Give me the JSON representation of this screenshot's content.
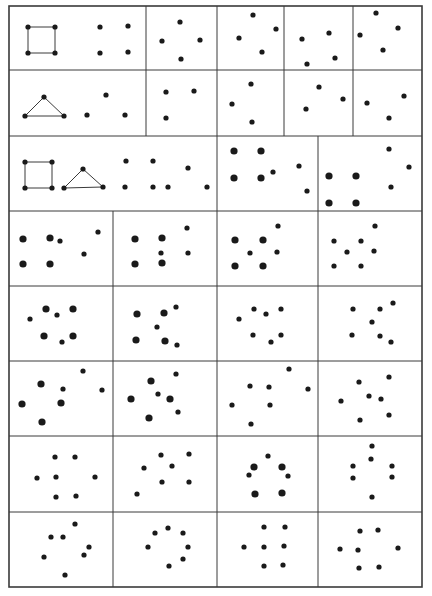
{
  "figure": {
    "title": "",
    "background": "#ffffff",
    "ink_color": "#1a1a1a",
    "line_color": "#3a3a3a",
    "outer_border": {
      "x1": 9,
      "y1": 6,
      "x2": 422,
      "y2": 587
    },
    "small_dot_r": 2.6,
    "big_dot_r": 3.6,
    "rows": [
      {
        "y1": 6,
        "y2": 70,
        "dividers": [
          146,
          217,
          284,
          353
        ]
      },
      {
        "y1": 70,
        "y2": 136,
        "dividers": [
          146,
          217,
          284,
          353
        ]
      },
      {
        "y1": 136,
        "y2": 211,
        "dividers": [
          217,
          318
        ]
      },
      {
        "y1": 211,
        "y2": 286,
        "dividers": [
          113,
          217,
          318
        ]
      },
      {
        "y1": 286,
        "y2": 361,
        "dividers": [
          113,
          217,
          318
        ]
      },
      {
        "y1": 361,
        "y2": 436,
        "dividers": [
          113,
          217,
          318
        ]
      },
      {
        "y1": 436,
        "y2": 512,
        "dividers": [
          113,
          217,
          318
        ]
      },
      {
        "y1": 512,
        "y2": 587,
        "dividers": [
          113,
          217,
          318
        ]
      }
    ],
    "shapes": [
      {
        "name": "square-r1",
        "type": "polygon",
        "points": [
          [
            28,
            27
          ],
          [
            55,
            27
          ],
          [
            55,
            53
          ],
          [
            28,
            53
          ]
        ]
      },
      {
        "name": "triangle-r2",
        "type": "polygon",
        "points": [
          [
            44,
            97
          ],
          [
            64,
            116
          ],
          [
            25,
            116
          ]
        ]
      },
      {
        "name": "square-r3",
        "type": "polygon",
        "points": [
          [
            25,
            162
          ],
          [
            52,
            162
          ],
          [
            52,
            188
          ],
          [
            25,
            188
          ]
        ]
      },
      {
        "name": "triangle-r3",
        "type": "polygon",
        "points": [
          [
            83,
            169
          ],
          [
            103,
            187
          ],
          [
            64,
            188
          ]
        ]
      }
    ],
    "cells": [
      {
        "row": 1,
        "col": 1,
        "small": [
          [
            28,
            27
          ],
          [
            55,
            27
          ],
          [
            28,
            53
          ],
          [
            55,
            53
          ],
          [
            100,
            27
          ],
          [
            128,
            26
          ],
          [
            100,
            53
          ],
          [
            128,
            52
          ]
        ],
        "big": []
      },
      {
        "row": 1,
        "col": 2,
        "small": [
          [
            180,
            22
          ],
          [
            162,
            41
          ],
          [
            200,
            40
          ],
          [
            181,
            59
          ]
        ],
        "big": []
      },
      {
        "row": 1,
        "col": 3,
        "small": [
          [
            253,
            15
          ],
          [
            239,
            38
          ],
          [
            276,
            29
          ],
          [
            262,
            52
          ]
        ],
        "big": []
      },
      {
        "row": 1,
        "col": 4,
        "small": [
          [
            302,
            39
          ],
          [
            329,
            33
          ],
          [
            307,
            64
          ],
          [
            335,
            58
          ]
        ],
        "big": []
      },
      {
        "row": 1,
        "col": 5,
        "small": [
          [
            376,
            13
          ],
          [
            360,
            35
          ],
          [
            398,
            28
          ],
          [
            383,
            50
          ]
        ],
        "big": []
      },
      {
        "row": 2,
        "col": 1,
        "small": [
          [
            44,
            97
          ],
          [
            25,
            116
          ],
          [
            64,
            116
          ],
          [
            106,
            95
          ],
          [
            87,
            115
          ],
          [
            125,
            115
          ]
        ],
        "big": []
      },
      {
        "row": 2,
        "col": 2,
        "small": [
          [
            166,
            92
          ],
          [
            194,
            91
          ],
          [
            166,
            118
          ]
        ],
        "big": []
      },
      {
        "row": 2,
        "col": 3,
        "small": [
          [
            251,
            84
          ],
          [
            232,
            104
          ],
          [
            252,
            122
          ]
        ],
        "big": []
      },
      {
        "row": 2,
        "col": 4,
        "small": [
          [
            319,
            87
          ],
          [
            343,
            99
          ],
          [
            306,
            109
          ]
        ],
        "big": []
      },
      {
        "row": 2,
        "col": 5,
        "small": [
          [
            367,
            103
          ],
          [
            404,
            96
          ],
          [
            389,
            118
          ]
        ],
        "big": []
      },
      {
        "row": 3,
        "col": 1,
        "small": [
          [
            25,
            162
          ],
          [
            52,
            162
          ],
          [
            25,
            188
          ],
          [
            52,
            188
          ],
          [
            83,
            169
          ],
          [
            64,
            188
          ],
          [
            103,
            187
          ],
          [
            126,
            161
          ],
          [
            153,
            161
          ],
          [
            188,
            168
          ],
          [
            125,
            187
          ],
          [
            153,
            187
          ],
          [
            168,
            187
          ],
          [
            207,
            187
          ]
        ],
        "big": []
      },
      {
        "row": 3,
        "col": 2,
        "small": [
          [
            273,
            172
          ],
          [
            299,
            166
          ],
          [
            307,
            191
          ]
        ],
        "big": [
          [
            234,
            151
          ],
          [
            261,
            151
          ],
          [
            234,
            178
          ],
          [
            261,
            178
          ]
        ]
      },
      {
        "row": 3,
        "col": 3,
        "small": [
          [
            389,
            149
          ],
          [
            409,
            167
          ],
          [
            391,
            187
          ]
        ],
        "big": [
          [
            329,
            176
          ],
          [
            356,
            176
          ],
          [
            329,
            203
          ],
          [
            356,
            203
          ]
        ]
      },
      {
        "row": 4,
        "col": 1,
        "small": [
          [
            60,
            241
          ],
          [
            98,
            232
          ],
          [
            84,
            254
          ]
        ],
        "big": [
          [
            23,
            239
          ],
          [
            50,
            238
          ],
          [
            23,
            264
          ],
          [
            50,
            264
          ]
        ]
      },
      {
        "row": 4,
        "col": 2,
        "small": [
          [
            187,
            228
          ],
          [
            161,
            253
          ],
          [
            188,
            253
          ]
        ],
        "big": [
          [
            135,
            239
          ],
          [
            162,
            238
          ],
          [
            135,
            264
          ],
          [
            162,
            263
          ]
        ]
      },
      {
        "row": 4,
        "col": 3,
        "small": [
          [
            278,
            226
          ],
          [
            250,
            253
          ],
          [
            277,
            252
          ]
        ],
        "big": [
          [
            235,
            240
          ],
          [
            263,
            240
          ],
          [
            235,
            266
          ],
          [
            263,
            266
          ]
        ]
      },
      {
        "row": 4,
        "col": 4,
        "small": [
          [
            334,
            241
          ],
          [
            361,
            241
          ],
          [
            347,
            252
          ],
          [
            375,
            226
          ],
          [
            374,
            251
          ],
          [
            334,
            266
          ],
          [
            361,
            266
          ]
        ],
        "big": []
      },
      {
        "row": 5,
        "col": 1,
        "small": [
          [
            30,
            319
          ],
          [
            57,
            315
          ],
          [
            62,
            342
          ]
        ],
        "big": [
          [
            46,
            309
          ],
          [
            73,
            309
          ],
          [
            44,
            336
          ],
          [
            73,
            336
          ]
        ]
      },
      {
        "row": 5,
        "col": 2,
        "small": [
          [
            176,
            307
          ],
          [
            157,
            327
          ],
          [
            177,
            345
          ]
        ],
        "big": [
          [
            137,
            314
          ],
          [
            164,
            313
          ],
          [
            136,
            340
          ],
          [
            165,
            341
          ]
        ]
      },
      {
        "row": 5,
        "col": 3,
        "small": [
          [
            254,
            309
          ],
          [
            266,
            314
          ],
          [
            281,
            309
          ],
          [
            239,
            319
          ],
          [
            253,
            335
          ],
          [
            271,
            342
          ],
          [
            281,
            335
          ]
        ],
        "big": []
      },
      {
        "row": 5,
        "col": 4,
        "small": [
          [
            353,
            309
          ],
          [
            380,
            309
          ],
          [
            393,
            303
          ],
          [
            372,
            322
          ],
          [
            352,
            335
          ],
          [
            380,
            336
          ],
          [
            391,
            342
          ]
        ],
        "big": []
      },
      {
        "row": 6,
        "col": 1,
        "small": [
          [
            63,
            389
          ],
          [
            83,
            371
          ],
          [
            102,
            390
          ]
        ],
        "big": [
          [
            41,
            384
          ],
          [
            22,
            404
          ],
          [
            61,
            403
          ],
          [
            42,
            422
          ]
        ]
      },
      {
        "row": 6,
        "col": 2,
        "small": [
          [
            176,
            374
          ],
          [
            158,
            394
          ],
          [
            178,
            412
          ]
        ],
        "big": [
          [
            151,
            381
          ],
          [
            131,
            399
          ],
          [
            170,
            399
          ],
          [
            149,
            418
          ]
        ]
      },
      {
        "row": 6,
        "col": 3,
        "small": [
          [
            289,
            369
          ],
          [
            250,
            386
          ],
          [
            269,
            387
          ],
          [
            308,
            389
          ],
          [
            232,
            405
          ],
          [
            270,
            405
          ],
          [
            251,
            424
          ]
        ],
        "big": []
      },
      {
        "row": 6,
        "col": 4,
        "small": [
          [
            359,
            382
          ],
          [
            389,
            377
          ],
          [
            341,
            401
          ],
          [
            369,
            396
          ],
          [
            381,
            399
          ],
          [
            360,
            420
          ],
          [
            389,
            415
          ]
        ],
        "big": []
      },
      {
        "row": 7,
        "col": 1,
        "small": [
          [
            55,
            457
          ],
          [
            75,
            457
          ],
          [
            37,
            478
          ],
          [
            56,
            477
          ],
          [
            95,
            477
          ],
          [
            56,
            497
          ],
          [
            76,
            496
          ]
        ],
        "big": []
      },
      {
        "row": 7,
        "col": 2,
        "small": [
          [
            161,
            455
          ],
          [
            189,
            454
          ],
          [
            144,
            468
          ],
          [
            172,
            466
          ],
          [
            162,
            482
          ],
          [
            189,
            482
          ],
          [
            137,
            494
          ]
        ],
        "big": []
      },
      {
        "row": 7,
        "col": 3,
        "small": [
          [
            268,
            456
          ],
          [
            249,
            475
          ],
          [
            288,
            476
          ]
        ],
        "big": [
          [
            254,
            467
          ],
          [
            282,
            467
          ],
          [
            255,
            494
          ],
          [
            282,
            493
          ]
        ]
      },
      {
        "row": 7,
        "col": 4,
        "small": [
          [
            372,
            446
          ],
          [
            371,
            459
          ],
          [
            353,
            466
          ],
          [
            392,
            466
          ],
          [
            353,
            478
          ],
          [
            392,
            477
          ],
          [
            372,
            497
          ]
        ],
        "big": []
      },
      {
        "row": 8,
        "col": 1,
        "small": [
          [
            75,
            524
          ],
          [
            51,
            537
          ],
          [
            63,
            537
          ],
          [
            89,
            547
          ],
          [
            44,
            557
          ],
          [
            84,
            555
          ],
          [
            65,
            575
          ]
        ],
        "big": []
      },
      {
        "row": 8,
        "col": 2,
        "small": [
          [
            168,
            528
          ],
          [
            155,
            533
          ],
          [
            183,
            533
          ],
          [
            148,
            547
          ],
          [
            188,
            547
          ],
          [
            183,
            559
          ],
          [
            169,
            566
          ]
        ],
        "big": []
      },
      {
        "row": 8,
        "col": 3,
        "small": [
          [
            264,
            527
          ],
          [
            285,
            527
          ],
          [
            244,
            547
          ],
          [
            264,
            547
          ],
          [
            284,
            546
          ],
          [
            264,
            566
          ],
          [
            283,
            565
          ]
        ],
        "big": []
      },
      {
        "row": 8,
        "col": 4,
        "small": [
          [
            360,
            531
          ],
          [
            378,
            530
          ],
          [
            340,
            549
          ],
          [
            358,
            550
          ],
          [
            398,
            548
          ],
          [
            359,
            568
          ],
          [
            379,
            567
          ]
        ],
        "big": []
      }
    ]
  }
}
